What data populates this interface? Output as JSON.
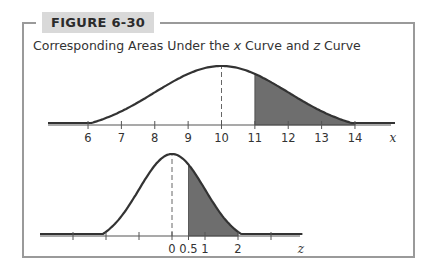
{
  "figure": {
    "label": "FIGURE 6-30",
    "title_prefix": "Corresponding Areas Under the ",
    "title_var1": "x",
    "title_middle": " Curve and ",
    "title_var2": "z",
    "title_suffix": " Curve"
  },
  "colors": {
    "curve": "#333333",
    "shade": "#6e6e6e",
    "frame": "#9a9a9a",
    "badge_bg": "#d9d9d9"
  },
  "chart_data": [
    {
      "type": "area",
      "title": "x Curve",
      "xlabel": "x",
      "ylabel": "",
      "distribution": "normal",
      "mean": 10,
      "std": 2,
      "tick_labels": [
        "6",
        "7",
        "8",
        "9",
        "10",
        "11",
        "12",
        "13",
        "14"
      ],
      "ticks": [
        6,
        7,
        8,
        9,
        10,
        11,
        12,
        13,
        14
      ],
      "xlim": [
        4.8,
        15.2
      ],
      "shaded_region": [
        11,
        14
      ],
      "mean_line": {
        "x": 10,
        "style": "dashed"
      },
      "grid": false,
      "legend": null
    },
    {
      "type": "area",
      "title": "z Curve",
      "xlabel": "z",
      "ylabel": "",
      "distribution": "standard normal",
      "mean": 0,
      "std": 1,
      "tick_labels": [
        "0",
        "0.5",
        "1",
        "2"
      ],
      "ticks": [
        -3,
        -2,
        -1,
        0,
        0.5,
        1,
        2,
        3
      ],
      "xlim": [
        -4,
        4
      ],
      "shaded_region": [
        0.5,
        2
      ],
      "mean_line": {
        "x": 0,
        "style": "dashed"
      },
      "grid": false,
      "legend": null
    }
  ]
}
